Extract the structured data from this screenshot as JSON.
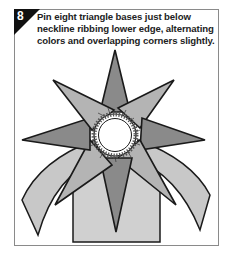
{
  "step": {
    "number": "8",
    "instruction": "Pin eight triangle bases just below neckline ribbing lower edge, alternating colors and overlapping corners slightly."
  },
  "illustration": {
    "subject": "eight-point-star-collar",
    "triangle_count": 8,
    "colors": {
      "dark_triangle": "#8a8a8a",
      "light_triangle": "#b4b4b4",
      "sweater_body": "#d0d0d0",
      "outline": "#1a1a1a",
      "badge": "#111111"
    }
  }
}
